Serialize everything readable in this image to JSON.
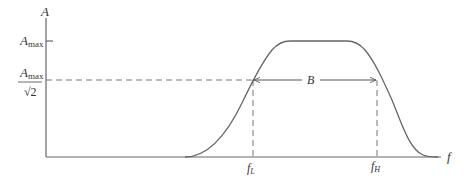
{
  "diagram": {
    "y_axis_label": "A",
    "x_axis_label": "f",
    "amax_label": {
      "base": "A",
      "sub": "max"
    },
    "half_power_label": {
      "num_base": "A",
      "num_sub": "max",
      "den": "√2"
    },
    "bandwidth_label": "B",
    "f_low_label": {
      "base": "f",
      "sub": "L"
    },
    "f_high_label": {
      "base": "f",
      "sub": "H"
    },
    "colors": {
      "line": "#555555",
      "curve": "#666666",
      "dash": "#777777"
    }
  }
}
